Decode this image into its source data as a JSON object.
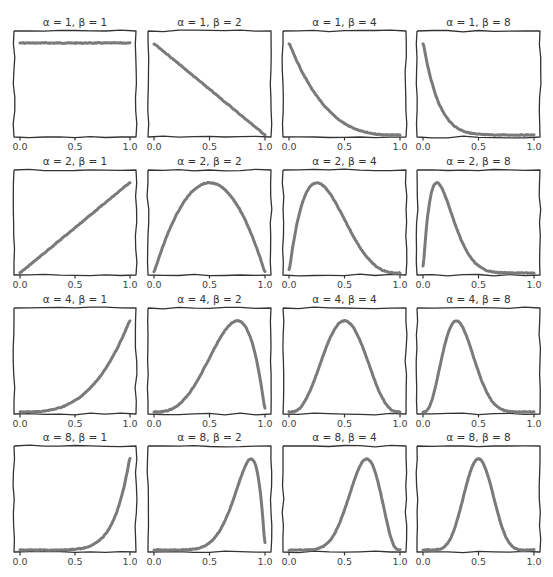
{
  "chart_data": {
    "type": "line",
    "title": "",
    "style": "xkcd hand-drawn",
    "layout": {
      "rows": 4,
      "cols": 4,
      "grid": false,
      "legend": "none",
      "yticks": "hidden"
    },
    "xlabel": "",
    "ylabel": "",
    "xlim": [
      0.0,
      1.0
    ],
    "xtick_labels": [
      "0.0",
      "0.5",
      "1.0"
    ],
    "line_color": "#7a7a7a",
    "frame_color": "#333333",
    "panels": [
      {
        "title": "α = 1, β = 1",
        "alpha": 1,
        "beta": 1,
        "peak_x": null
      },
      {
        "title": "α = 1, β = 2",
        "alpha": 1,
        "beta": 2,
        "peak_x": 0.0
      },
      {
        "title": "α = 1, β = 4",
        "alpha": 1,
        "beta": 4,
        "peak_x": 0.0
      },
      {
        "title": "α = 1, β = 8",
        "alpha": 1,
        "beta": 8,
        "peak_x": 0.0
      },
      {
        "title": "α = 2, β = 1",
        "alpha": 2,
        "beta": 1,
        "peak_x": 1.0
      },
      {
        "title": "α = 2, β = 2",
        "alpha": 2,
        "beta": 2,
        "peak_x": 0.5
      },
      {
        "title": "α = 2, β = 4",
        "alpha": 2,
        "beta": 4,
        "peak_x": 0.25
      },
      {
        "title": "α = 2, β = 8",
        "alpha": 2,
        "beta": 8,
        "peak_x": 0.125
      },
      {
        "title": "α = 4, β = 1",
        "alpha": 4,
        "beta": 1,
        "peak_x": 1.0
      },
      {
        "title": "α = 4, β = 2",
        "alpha": 4,
        "beta": 2,
        "peak_x": 0.75
      },
      {
        "title": "α = 4, β = 4",
        "alpha": 4,
        "beta": 4,
        "peak_x": 0.5
      },
      {
        "title": "α = 4, β = 8",
        "alpha": 4,
        "beta": 8,
        "peak_x": 0.3
      },
      {
        "title": "α = 8, β = 1",
        "alpha": 8,
        "beta": 1,
        "peak_x": 1.0
      },
      {
        "title": "α = 8, β = 2",
        "alpha": 8,
        "beta": 2,
        "peak_x": 0.875
      },
      {
        "title": "α = 8, β = 4",
        "alpha": 8,
        "beta": 4,
        "peak_x": 0.7
      },
      {
        "title": "α = 8, β = 8",
        "alpha": 8,
        "beta": 8,
        "peak_x": 0.5
      }
    ]
  }
}
